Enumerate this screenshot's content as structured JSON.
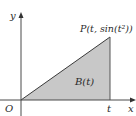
{
  "figure": {
    "type": "area-under-line diagram",
    "axes": {
      "x_label": "x",
      "y_label": "y",
      "origin_label": "O",
      "x_tick_label": "t"
    },
    "point_label": "P(t, sin(t²))",
    "region_label": "B(t)",
    "colors": {
      "fill": "#c8c8c8",
      "stroke": "#3a3a3a",
      "axis": "#4a4a4a"
    }
  }
}
